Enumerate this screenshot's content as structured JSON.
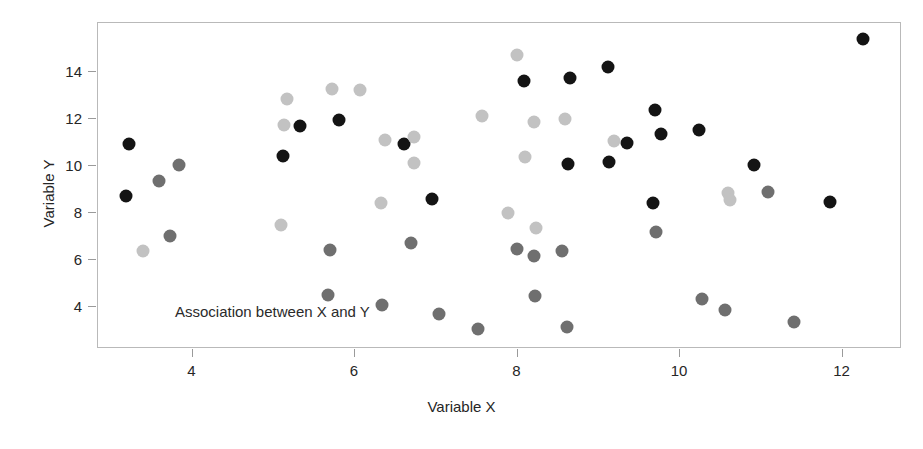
{
  "chart_data": {
    "type": "scatter",
    "title": "",
    "xlabel": "Variable X",
    "ylabel": "Variable Y",
    "xlim": [
      2.13,
      12.62
    ],
    "ylim": [
      2.55,
      15.92
    ],
    "xticks": [
      4,
      6,
      8,
      10,
      12
    ],
    "yticks": [
      4,
      6,
      8,
      10,
      12,
      14
    ],
    "xtick_labels": [
      "4",
      "6",
      "8",
      "10",
      "12"
    ],
    "ytick_labels": [
      "4",
      "6",
      "8",
      "10",
      "12",
      "14"
    ],
    "grid": false,
    "legend": null,
    "annotations": [
      {
        "text": "Association between X and Y",
        "x": 3.1,
        "y": 4.05
      }
    ],
    "marker_groups": [
      {
        "name": "dark",
        "color": "#141414",
        "size": 13
      },
      {
        "name": "medium-gray",
        "color": "#6f6f6f",
        "size": 13
      },
      {
        "name": "light-gray",
        "color": "#c2c2c2",
        "size": 13
      }
    ],
    "points": [
      {
        "x": 3.23,
        "y": 10.88,
        "group": "dark"
      },
      {
        "x": 3.19,
        "y": 8.68,
        "group": "dark"
      },
      {
        "x": 5.12,
        "y": 10.4,
        "group": "dark"
      },
      {
        "x": 5.33,
        "y": 11.66,
        "group": "dark"
      },
      {
        "x": 5.82,
        "y": 11.9,
        "group": "dark"
      },
      {
        "x": 6.62,
        "y": 10.88,
        "group": "dark"
      },
      {
        "x": 6.96,
        "y": 8.56,
        "group": "dark"
      },
      {
        "x": 8.09,
        "y": 13.56,
        "group": "dark"
      },
      {
        "x": 8.66,
        "y": 13.7,
        "group": "dark"
      },
      {
        "x": 9.13,
        "y": 14.18,
        "group": "dark"
      },
      {
        "x": 8.63,
        "y": 10.04,
        "group": "dark"
      },
      {
        "x": 9.14,
        "y": 10.14,
        "group": "dark"
      },
      {
        "x": 9.36,
        "y": 10.94,
        "group": "dark"
      },
      {
        "x": 9.7,
        "y": 12.32,
        "group": "dark"
      },
      {
        "x": 9.78,
        "y": 11.32,
        "group": "dark"
      },
      {
        "x": 10.25,
        "y": 11.48,
        "group": "dark"
      },
      {
        "x": 10.92,
        "y": 10.0,
        "group": "dark"
      },
      {
        "x": 9.68,
        "y": 8.4,
        "group": "dark"
      },
      {
        "x": 11.86,
        "y": 8.44,
        "group": "dark"
      },
      {
        "x": 12.27,
        "y": 15.36,
        "group": "dark"
      },
      {
        "x": 3.6,
        "y": 9.34,
        "group": "medium-gray"
      },
      {
        "x": 3.84,
        "y": 9.98,
        "group": "medium-gray"
      },
      {
        "x": 3.74,
        "y": 6.98,
        "group": "medium-gray"
      },
      {
        "x": 5.7,
        "y": 6.4,
        "group": "medium-gray"
      },
      {
        "x": 5.68,
        "y": 4.46,
        "group": "medium-gray"
      },
      {
        "x": 6.35,
        "y": 4.06,
        "group": "medium-gray"
      },
      {
        "x": 6.7,
        "y": 6.7,
        "group": "medium-gray"
      },
      {
        "x": 7.04,
        "y": 3.64,
        "group": "medium-gray"
      },
      {
        "x": 7.52,
        "y": 3.04,
        "group": "medium-gray"
      },
      {
        "x": 8.0,
        "y": 6.44,
        "group": "medium-gray"
      },
      {
        "x": 8.22,
        "y": 6.12,
        "group": "medium-gray"
      },
      {
        "x": 8.56,
        "y": 6.32,
        "group": "medium-gray"
      },
      {
        "x": 8.23,
        "y": 4.42,
        "group": "medium-gray"
      },
      {
        "x": 8.62,
        "y": 3.1,
        "group": "medium-gray"
      },
      {
        "x": 9.72,
        "y": 7.14,
        "group": "medium-gray"
      },
      {
        "x": 10.28,
        "y": 4.28,
        "group": "medium-gray"
      },
      {
        "x": 10.56,
        "y": 3.84,
        "group": "medium-gray"
      },
      {
        "x": 11.1,
        "y": 8.84,
        "group": "medium-gray"
      },
      {
        "x": 11.42,
        "y": 3.32,
        "group": "medium-gray"
      },
      {
        "x": 3.4,
        "y": 6.32,
        "group": "light-gray"
      },
      {
        "x": 5.14,
        "y": 11.7,
        "group": "light-gray"
      },
      {
        "x": 5.17,
        "y": 12.82,
        "group": "light-gray"
      },
      {
        "x": 5.1,
        "y": 7.44,
        "group": "light-gray"
      },
      {
        "x": 5.73,
        "y": 13.24,
        "group": "light-gray"
      },
      {
        "x": 6.07,
        "y": 13.2,
        "group": "light-gray"
      },
      {
        "x": 6.33,
        "y": 8.38,
        "group": "light-gray"
      },
      {
        "x": 6.38,
        "y": 11.06,
        "group": "light-gray"
      },
      {
        "x": 6.74,
        "y": 11.2,
        "group": "light-gray"
      },
      {
        "x": 6.74,
        "y": 10.1,
        "group": "light-gray"
      },
      {
        "x": 7.58,
        "y": 12.1,
        "group": "light-gray"
      },
      {
        "x": 8.01,
        "y": 14.66,
        "group": "light-gray"
      },
      {
        "x": 8.22,
        "y": 11.84,
        "group": "light-gray"
      },
      {
        "x": 8.6,
        "y": 11.94,
        "group": "light-gray"
      },
      {
        "x": 8.1,
        "y": 10.34,
        "group": "light-gray"
      },
      {
        "x": 9.2,
        "y": 11.02,
        "group": "light-gray"
      },
      {
        "x": 7.9,
        "y": 7.94,
        "group": "light-gray"
      },
      {
        "x": 8.24,
        "y": 7.32,
        "group": "light-gray"
      },
      {
        "x": 10.6,
        "y": 8.8,
        "group": "light-gray"
      },
      {
        "x": 10.63,
        "y": 8.5,
        "group": "light-gray"
      }
    ]
  }
}
